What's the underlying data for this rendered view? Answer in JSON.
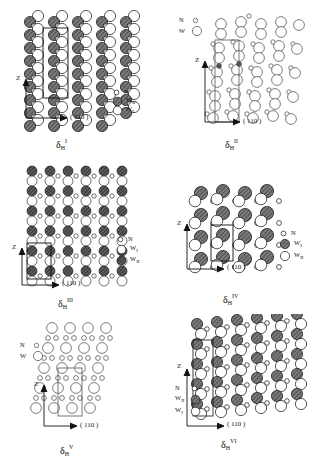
{
  "figure": {
    "type": "crystal-structure-projection-set",
    "panel_count": 6,
    "axes": {
      "vertical": "Z",
      "horizontal": "( 110 )"
    },
    "species": {
      "N": "nitrogen (small open circle)",
      "W_I": "tungsten site I",
      "W_II": "tungsten site II",
      "W": "tungsten (undifferentiated)"
    }
  },
  "panels": [
    {
      "id": "p1",
      "caption": {
        "delta": "δ",
        "sub": "H",
        "sup": "I"
      },
      "axis_z": "Z",
      "axis_h": "( 110 )",
      "legend_position": "right",
      "legend": [
        {
          "label": "N",
          "sub": "",
          "style": "small-open"
        },
        {
          "label": "W",
          "sub": "II",
          "style": "hatched"
        },
        {
          "label": "W",
          "sub": "I",
          "style": "large-open"
        }
      ],
      "unit_cell": true,
      "columns": 5,
      "rows": 9,
      "motif": "alternating hatched / open column pairs with interstitial N"
    },
    {
      "id": "p2",
      "caption": {
        "delta": "δ",
        "sub": "H",
        "sup": "II"
      },
      "axis_z": "Z",
      "axis_h": "( 110 )",
      "legend_position": "top-left",
      "legend": [
        {
          "label": "N",
          "sub": "",
          "style": "small-open"
        },
        {
          "label": "W",
          "sub": "",
          "style": "large-open"
        }
      ],
      "unit_cell": true,
      "columns": 5,
      "rows": 8,
      "motif": "all-open tungsten pairs, small N circles between rows"
    },
    {
      "id": "p3",
      "caption": {
        "delta": "δ",
        "sub": "H",
        "sup": "III"
      },
      "axis_z": "Z",
      "axis_h": "( 110 )",
      "legend_position": "right",
      "legend": [
        {
          "label": "N",
          "sub": "",
          "style": "small-open"
        },
        {
          "label": "W",
          "sub": "I",
          "style": "large-open"
        },
        {
          "label": "W",
          "sub": "II",
          "style": "hatched"
        }
      ],
      "unit_cell": true,
      "columns": 6,
      "rows": 12,
      "motif": "dense vertical stripes, hatched and open columns alternating"
    },
    {
      "id": "p4",
      "caption": {
        "delta": "δ",
        "sub": "H",
        "sup": "IV"
      },
      "axis_z": "Z",
      "axis_h": "( 110 )",
      "legend_position": "right",
      "legend": [
        {
          "label": "N",
          "sub": "",
          "style": "small-open"
        },
        {
          "label": "W",
          "sub": "I",
          "style": "hatched"
        },
        {
          "label": "W",
          "sub": "II",
          "style": "large-open"
        }
      ],
      "unit_cell": true,
      "columns": 4,
      "rows": 5,
      "motif": "horizontal layers of hatched over open spheres, N bridging"
    },
    {
      "id": "p5",
      "caption": {
        "delta": "δ",
        "sub": "H",
        "sup": "V"
      },
      "axis_z": "Z",
      "axis_h": "( 110 )",
      "legend_position": "left",
      "legend": [
        {
          "label": "N",
          "sub": "",
          "style": "small-open"
        },
        {
          "label": "W",
          "sub": "",
          "style": "large-open"
        }
      ],
      "unit_cell": true,
      "columns": 6,
      "rows": 8,
      "motif": "open circle lattice with paired small N circles"
    },
    {
      "id": "p6",
      "caption": {
        "delta": "δ",
        "sub": "H",
        "sup": "VI"
      },
      "axis_z": "Z",
      "axis_h": "( 110 )",
      "legend_position": "left",
      "legend": [
        {
          "label": "N",
          "sub": "",
          "style": "small-open"
        },
        {
          "label": "W",
          "sub": "II",
          "style": "hatched"
        },
        {
          "label": "W",
          "sub": "I",
          "style": "large-open"
        }
      ],
      "unit_cell": true,
      "columns": 6,
      "rows": 10,
      "motif": "tilted dense columns, hatched and open alternating with N"
    }
  ]
}
